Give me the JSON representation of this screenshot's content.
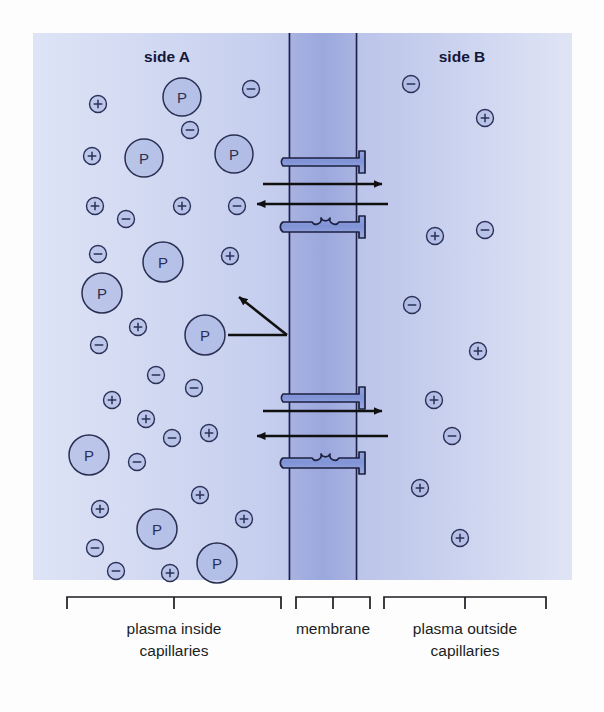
{
  "figure": {
    "title_labels": {
      "side_a": "side A",
      "side_b": "side B"
    },
    "bracket_labels": {
      "left_line1": "plasma inside",
      "left_line2": "capillaries",
      "center_line1": "membrane",
      "center_line2": "",
      "right_line1": "plasma outside",
      "right_line2": "capillaries"
    },
    "particle_glyphs": {
      "protein": "P",
      "cation": "+",
      "anion": "−"
    },
    "colors": {
      "panel_light": "#dfe5f6",
      "panel_dark": "#b8c1e8",
      "membrane_fill": "#aab4e2",
      "channel_fill": "#8d9ddc",
      "outline": "#1d2040",
      "arrow": "#101010",
      "text_dark": "#14173a",
      "page_background": "#fdfdfe"
    },
    "geometry": {
      "panel": {
        "x": 33,
        "y": 33,
        "width": 539,
        "height": 547
      },
      "membrane": {
        "left": 288,
        "right": 358
      },
      "bracket_row_y": 597
    }
  },
  "chart_data": {
    "type": "diagram",
    "regions": [
      {
        "name": "side A",
        "description": "plasma inside capillaries"
      },
      {
        "name": "membrane",
        "description": "membrane"
      },
      {
        "name": "side B",
        "description": "plasma outside capillaries"
      }
    ],
    "side_a_proteins": [
      {
        "x": 182,
        "y": 97,
        "r": 19
      },
      {
        "x": 144,
        "y": 158,
        "r": 19
      },
      {
        "x": 234,
        "y": 154,
        "r": 19
      },
      {
        "x": 163,
        "y": 262,
        "r": 20
      },
      {
        "x": 102,
        "y": 293,
        "r": 20
      },
      {
        "x": 205,
        "y": 335,
        "r": 20
      },
      {
        "x": 89,
        "y": 455,
        "r": 20
      },
      {
        "x": 157,
        "y": 529,
        "r": 20
      },
      {
        "x": 217,
        "y": 563,
        "r": 20
      }
    ],
    "side_a_ions": [
      {
        "x": 98,
        "y": 104,
        "charge": "+"
      },
      {
        "x": 251,
        "y": 89,
        "charge": "-"
      },
      {
        "x": 190,
        "y": 130,
        "charge": "-"
      },
      {
        "x": 92,
        "y": 156,
        "charge": "+"
      },
      {
        "x": 95,
        "y": 206,
        "charge": "+"
      },
      {
        "x": 182,
        "y": 206,
        "charge": "+"
      },
      {
        "x": 237,
        "y": 206,
        "charge": "-"
      },
      {
        "x": 126,
        "y": 219,
        "charge": "-"
      },
      {
        "x": 98,
        "y": 254,
        "charge": "-"
      },
      {
        "x": 230,
        "y": 256,
        "charge": "+"
      },
      {
        "x": 138,
        "y": 327,
        "charge": "+"
      },
      {
        "x": 99,
        "y": 345,
        "charge": "-"
      },
      {
        "x": 156,
        "y": 375,
        "charge": "-"
      },
      {
        "x": 194,
        "y": 388,
        "charge": "-"
      },
      {
        "x": 112,
        "y": 400,
        "charge": "+"
      },
      {
        "x": 146,
        "y": 419,
        "charge": "+"
      },
      {
        "x": 172,
        "y": 438,
        "charge": "-"
      },
      {
        "x": 209,
        "y": 433,
        "charge": "+"
      },
      {
        "x": 137,
        "y": 462,
        "charge": "-"
      },
      {
        "x": 200,
        "y": 495,
        "charge": "+"
      },
      {
        "x": 100,
        "y": 509,
        "charge": "+"
      },
      {
        "x": 244,
        "y": 519,
        "charge": "+"
      },
      {
        "x": 95,
        "y": 548,
        "charge": "-"
      },
      {
        "x": 116,
        "y": 571,
        "charge": "-"
      },
      {
        "x": 170,
        "y": 573,
        "charge": "+"
      }
    ],
    "side_b_ions": [
      {
        "x": 411,
        "y": 84,
        "charge": "-"
      },
      {
        "x": 485,
        "y": 118,
        "charge": "+"
      },
      {
        "x": 435,
        "y": 236,
        "charge": "+"
      },
      {
        "x": 485,
        "y": 230,
        "charge": "-"
      },
      {
        "x": 412,
        "y": 305,
        "charge": "-"
      },
      {
        "x": 478,
        "y": 351,
        "charge": "+"
      },
      {
        "x": 434,
        "y": 400,
        "charge": "+"
      },
      {
        "x": 452,
        "y": 436,
        "charge": "-"
      },
      {
        "x": 420,
        "y": 488,
        "charge": "+"
      },
      {
        "x": 460,
        "y": 538,
        "charge": "+"
      }
    ],
    "channels": [
      {
        "id": "upper",
        "top_protein_y": 166,
        "bottom_protein_y": 224,
        "arrow_right_y": 185,
        "arrow_left_y": 205
      },
      {
        "id": "lower",
        "top_protein_y": 402,
        "bottom_protein_y": 460,
        "arrow_right_y": 412,
        "arrow_left_y": 437
      }
    ],
    "deflection_arrow": {
      "from_protein": {
        "x": 205,
        "y": 335
      },
      "contact": {
        "x": 287,
        "y": 335
      },
      "to": {
        "x": 240,
        "y": 296
      }
    }
  }
}
